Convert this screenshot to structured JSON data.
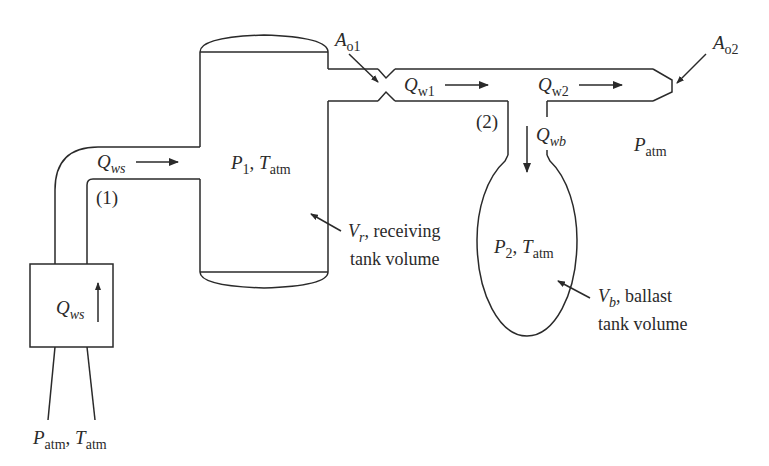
{
  "diagram": {
    "type": "pneumatic tank system",
    "components": {
      "receiving_tank": {
        "pressure": "P",
        "pressure_sub": "1",
        "temp": "T",
        "temp_sub": "atm",
        "volume_symbol": "V",
        "volume_sub": "r",
        "volume_text": ", receiving",
        "volume_text2": "tank volume"
      },
      "ballast_tank": {
        "pressure": "P",
        "pressure_sub": "2",
        "temp": "T",
        "temp_sub": "atm",
        "volume_symbol": "V",
        "volume_sub": "b",
        "volume_text": ", ballast",
        "volume_text2": "tank volume"
      },
      "compressor": {
        "flow": "Q",
        "flow_sub": "ws"
      },
      "inlet": {
        "p": "P",
        "p_sub": "atm",
        "sep": ",",
        "t": "T",
        "t_sub": "atm"
      },
      "ambient": {
        "p": "P",
        "p_sub": "atm"
      }
    },
    "flows": {
      "supply": {
        "q": "Q",
        "sub": "ws"
      },
      "w1": {
        "q": "Q",
        "sub": "w1"
      },
      "w2": {
        "q": "Q",
        "sub": "w2"
      },
      "wb": {
        "q": "Q",
        "sub": "wb"
      }
    },
    "orifices": {
      "o1": {
        "a": "A",
        "sub": "o1"
      },
      "o2": {
        "a": "A",
        "sub": "o2"
      }
    },
    "nodes": {
      "n1": "(1)",
      "n2": "(2)"
    }
  }
}
